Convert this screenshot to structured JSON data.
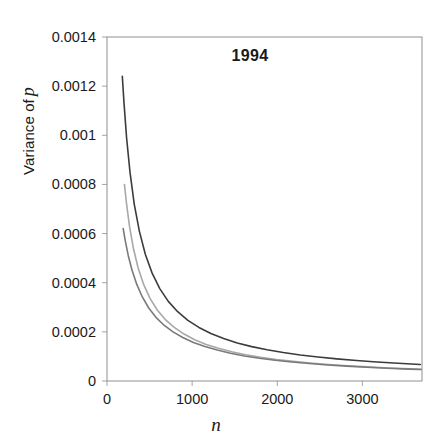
{
  "chart_data": {
    "type": "line",
    "title": "1994",
    "xlabel": "n",
    "ylabel_prefix": "Variance of",
    "ylabel_italic": "p",
    "xlim": [
      0,
      3700
    ],
    "ylim": [
      0,
      0.0014
    ],
    "xticks": [
      0,
      1000,
      2000,
      3000
    ],
    "xtick_labels": [
      "0",
      "1000",
      "2000",
      "3000"
    ],
    "yticks": [
      0,
      0.0002,
      0.0004,
      0.0006,
      0.0008,
      0.001,
      0.0012,
      0.0014
    ],
    "ytick_labels": [
      "0",
      "0.0002",
      "0.0004",
      "0.0006",
      "0.0008",
      "0.001",
      "0.0012",
      "0.0014"
    ],
    "grid": false,
    "legend": "none",
    "series": [
      {
        "name": "upper-curve",
        "color": "#3c3c3c",
        "x": [
          180,
          200,
          230,
          270,
          320,
          380,
          450,
          530,
          620,
          720,
          830,
          950,
          1080,
          1220,
          1370,
          1530,
          1700,
          1880,
          2070,
          2270,
          2480,
          2700,
          2930,
          3170,
          3420,
          3680
        ],
        "y": [
          0.00124,
          0.00113,
          0.00099,
          0.00085,
          0.00072,
          0.00061,
          0.000516,
          0.000439,
          0.000376,
          0.000324,
          0.000282,
          0.000247,
          0.000218,
          0.000193,
          0.000173,
          0.000155,
          0.00014,
          0.000127,
          0.000116,
          0.000106,
          9.76e-05,
          9e-05,
          8.34e-05,
          7.74e-05,
          7.21e-05,
          6.74e-05
        ]
      },
      {
        "name": "middle-curve",
        "color": "#a8a8a8",
        "x": [
          205,
          230,
          265,
          310,
          365,
          430,
          505,
          590,
          685,
          790,
          905,
          1030,
          1165,
          1310,
          1465,
          1630,
          1805,
          1990,
          2185,
          2390,
          2605,
          2830,
          3065,
          3310,
          3565,
          3690
        ],
        "y": [
          0.0008,
          0.00072,
          0.000628,
          0.00054,
          0.000461,
          0.000393,
          0.000336,
          0.000289,
          0.00025,
          0.000218,
          0.000191,
          0.000168,
          0.000149,
          0.000133,
          0.000119,
          0.000107,
          9.66e-05,
          8.78e-05,
          8e-05,
          7.32e-05,
          6.72e-05,
          6.2e-05,
          5.73e-05,
          5.32e-05,
          4.94e-05,
          4.78e-05
        ]
      },
      {
        "name": "lower-curve",
        "color": "#7a7a7a",
        "x": [
          190,
          215,
          250,
          295,
          350,
          415,
          490,
          575,
          670,
          775,
          890,
          1015,
          1150,
          1295,
          1450,
          1615,
          1790,
          1975,
          2170,
          2375,
          2590,
          2815,
          3050,
          3295,
          3550,
          3690
        ],
        "y": [
          0.00062,
          0.00057,
          0.00051,
          0.00045,
          0.000393,
          0.000342,
          0.000297,
          0.000259,
          0.000227,
          0.0002,
          0.000177,
          0.000157,
          0.00014,
          0.000126,
          0.000113,
          0.000102,
          9.27e-05,
          8.45e-05,
          7.74e-05,
          7.1e-05,
          6.54e-05,
          6.05e-05,
          5.6e-05,
          5.21e-05,
          4.85e-05,
          4.7e-05
        ]
      }
    ]
  }
}
